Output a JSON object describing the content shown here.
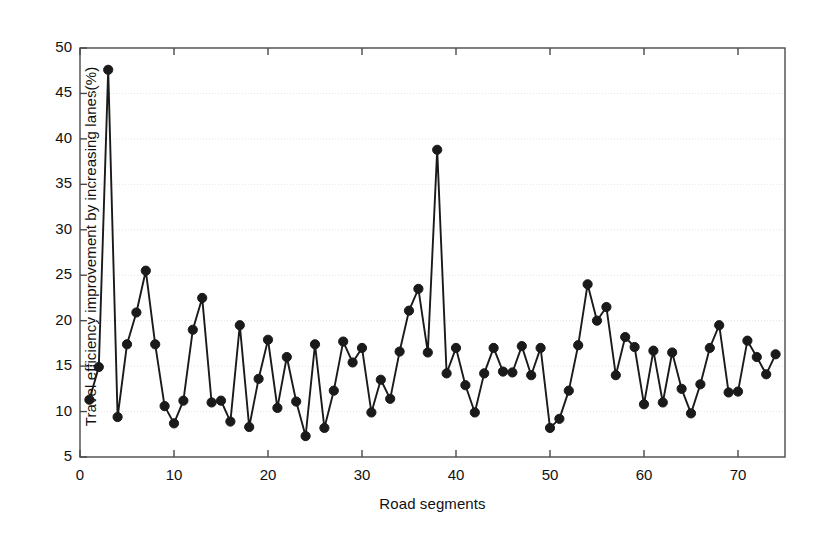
{
  "chart_data": {
    "type": "line",
    "title": "",
    "xlabel": "Road segments",
    "ylabel": "Travel  efficiency improvement by increasing lanes(%)",
    "xlim": [
      0,
      75
    ],
    "ylim": [
      5,
      50
    ],
    "xticks": [
      0,
      10,
      20,
      30,
      40,
      50,
      60,
      70
    ],
    "yticks": [
      5,
      10,
      15,
      20,
      25,
      30,
      35,
      40,
      45,
      50
    ],
    "grid": true,
    "grid_axis": "y",
    "legend": null,
    "marker": "filled-circle",
    "marker_color": "#1a1a1a",
    "line_color": "#1a1a1a",
    "series": [
      {
        "name": "Travel efficiency improvement",
        "x": [
          1,
          2,
          3,
          4,
          5,
          6,
          7,
          8,
          9,
          10,
          11,
          12,
          13,
          14,
          15,
          16,
          17,
          18,
          19,
          20,
          21,
          22,
          23,
          24,
          25,
          26,
          27,
          28,
          29,
          30,
          31,
          32,
          33,
          34,
          35,
          36,
          37,
          38,
          39,
          40,
          41,
          42,
          43,
          44,
          45,
          46,
          47,
          48,
          49,
          50,
          51,
          52,
          53,
          54,
          55,
          56,
          57,
          58,
          59,
          60,
          61,
          62,
          63,
          64,
          65,
          66,
          67,
          68,
          69,
          70,
          71,
          72,
          73,
          74
        ],
        "values": [
          11.3,
          14.9,
          47.6,
          9.4,
          17.4,
          20.9,
          25.5,
          17.4,
          10.6,
          8.7,
          11.2,
          19.0,
          22.5,
          11.0,
          11.2,
          8.9,
          19.5,
          8.3,
          13.6,
          17.9,
          10.4,
          16.0,
          11.1,
          7.3,
          17.4,
          8.2,
          12.3,
          17.7,
          15.4,
          17.0,
          9.9,
          13.5,
          11.4,
          16.6,
          21.1,
          23.5,
          16.5,
          38.8,
          14.2,
          17.0,
          12.9,
          9.9,
          14.2,
          17.0,
          14.4,
          14.3,
          17.2,
          14.0,
          17.0,
          8.2,
          9.2,
          12.3,
          17.3,
          24.0,
          20.0,
          21.5,
          14.0,
          18.2,
          17.1,
          10.8,
          16.7,
          11.0,
          16.5,
          12.5,
          9.8,
          13.0,
          17.0,
          19.5,
          12.1,
          12.2,
          17.8,
          16.0,
          14.1,
          16.3
        ]
      }
    ]
  },
  "figure": {
    "background_color": "#ffffff",
    "axes_color": "#4a4a4a",
    "grid_color": "#e3e3e8"
  }
}
